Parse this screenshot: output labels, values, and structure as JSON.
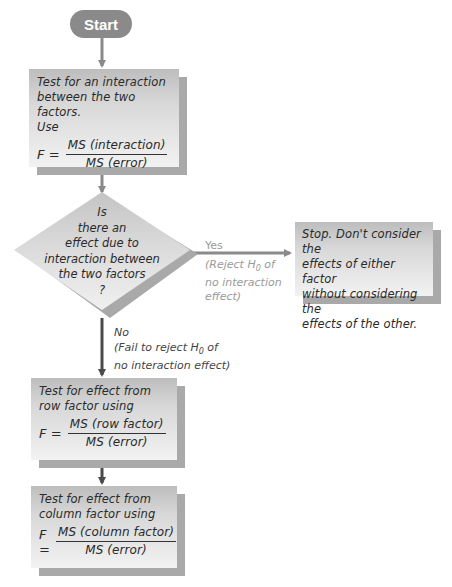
{
  "start": {
    "label": "Start"
  },
  "interaction_box": {
    "line1_a": "Test for an ",
    "line1_b": "interaction",
    "line2": "between the two factors.",
    "line3": "Use",
    "f_label": "F =",
    "numerator": "MS (interaction)",
    "denominator": "MS (error)"
  },
  "decision": {
    "lines": [
      "Is",
      "there an",
      "effect due to",
      "interaction between",
      "the two factors",
      "?"
    ]
  },
  "yes_branch": {
    "label": "Yes",
    "note_line1_a": "(Reject ",
    "note_h": "H",
    "note_sub": "0",
    "note_line1_b": " of",
    "note_line2": "no interaction",
    "note_line3": "effect)"
  },
  "stop_box": {
    "lines": [
      "Stop. Don't consider the",
      "effects of either factor",
      "without considering the",
      "effects of the other."
    ]
  },
  "no_branch": {
    "label": "No",
    "note_line1_a": "(Fail to reject ",
    "note_h": "H",
    "note_sub": "0",
    "note_line1_b": " of",
    "note_line2": "no interaction effect)"
  },
  "row_box": {
    "line1": "Test for effect from",
    "line2": "row factor using",
    "f_label": "F =",
    "numerator": "MS (row factor)",
    "denominator": "MS (error)"
  },
  "column_box": {
    "line1": "Test for effect from",
    "line2": "column factor using",
    "f_label": "F =",
    "numerator": "MS (column factor)",
    "denominator": "MS (error)"
  },
  "colors": {
    "arrow_gray": "#8a8a8a",
    "arrow_dark": "#555555",
    "box_shadow": "#a9a9a9"
  }
}
